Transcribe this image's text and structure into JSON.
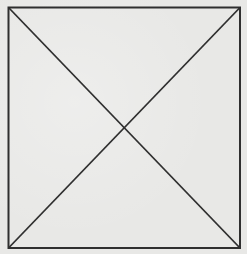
{
  "figure": {
    "type": "square-with-diagonals",
    "background_color": "#e8e8e6",
    "line_color": "#2f2f2f",
    "line_width": 2,
    "square": {
      "x": 8.5,
      "y": 7.5,
      "width": 231.5,
      "height": 240.5
    },
    "diagonals": [
      {
        "from": [
          8.5,
          7.5
        ],
        "to": [
          240,
          248
        ]
      },
      {
        "from": [
          240,
          7.5
        ],
        "to": [
          8.5,
          248
        ]
      }
    ],
    "intersection": [
      124,
      127
    ]
  }
}
